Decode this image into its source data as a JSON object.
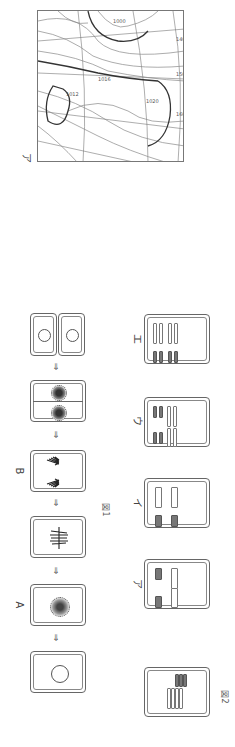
{
  "page": {
    "orientation": "rotated-90-clockwise",
    "background": "#ffffff"
  },
  "weather_map": {
    "label": "ア",
    "description": "surface weather chart with isobars and fronts",
    "grid_labels": [
      "140",
      "150",
      "160"
    ],
    "isobar_values": [
      "1000",
      "1008",
      "1012",
      "1016",
      "1020"
    ]
  },
  "figure1": {
    "caption": "図1",
    "stage_labels": {
      "a": "A",
      "b": "B"
    },
    "arrow_glyph": "⇒",
    "stages": [
      {
        "name": "interphase-cell"
      },
      {
        "name": "prophase-cell",
        "label": "A"
      },
      {
        "name": "metaphase-cell"
      },
      {
        "name": "anaphase-cell",
        "label": "B"
      },
      {
        "name": "telophase-cell"
      },
      {
        "name": "daughter-cells"
      }
    ]
  },
  "figure2": {
    "caption": "図2",
    "options": [
      {
        "label": "ア"
      },
      {
        "label": "イ"
      },
      {
        "label": "ウ"
      },
      {
        "label": "エ"
      }
    ]
  },
  "colors": {
    "line": "#666666",
    "chromosome_dark": "#777777",
    "chromosome_light": "#ffffff"
  }
}
